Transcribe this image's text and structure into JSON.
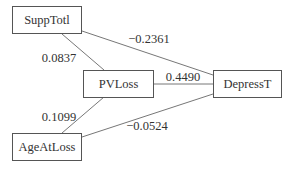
{
  "diagram": {
    "type": "path-diagram",
    "nodes": [
      {
        "id": "SuppTotl",
        "label": "SuppTotl"
      },
      {
        "id": "PVLoss",
        "label": "PVLoss"
      },
      {
        "id": "DepressT",
        "label": "DepressT"
      },
      {
        "id": "AgeAtLoss",
        "label": "AgeAtLoss"
      }
    ],
    "edges": [
      {
        "from": "SuppTotl",
        "to": "PVLoss",
        "coefficient": "0.0837"
      },
      {
        "from": "SuppTotl",
        "to": "DepressT",
        "coefficient": "−0.2361"
      },
      {
        "from": "PVLoss",
        "to": "DepressT",
        "coefficient": "0.4490"
      },
      {
        "from": "AgeAtLoss",
        "to": "PVLoss",
        "coefficient": "0.1099"
      },
      {
        "from": "AgeAtLoss",
        "to": "DepressT",
        "coefficient": "−0.0524"
      }
    ]
  },
  "colors": {
    "line": "#666666",
    "border": "#555555",
    "text": "#333333",
    "background": "#ffffff"
  }
}
